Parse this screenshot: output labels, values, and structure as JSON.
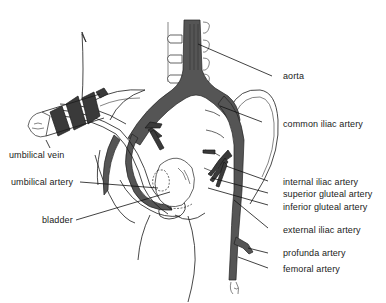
{
  "figure": {
    "labels": {
      "aorta": "aorta",
      "common_iliac_artery": "common iliac artery",
      "umbilical_vein": "umbilical vein",
      "internal_iliac_artery": "internal iliac artery",
      "superior_gluteal_artery": "superior gluteal artery",
      "umbilical_artery": "umbilical artery",
      "inferior_gluteal_artery": "inferior gluteal artery",
      "bladder": "bladder",
      "external_iliac_artery": "external iliac artery",
      "profunda_artery": "profunda artery",
      "femoral_artery": "femoral artery"
    },
    "colors": {
      "ink": "#1a1a1a",
      "vessel_fill": "#555555",
      "background": "#ffffff"
    }
  }
}
